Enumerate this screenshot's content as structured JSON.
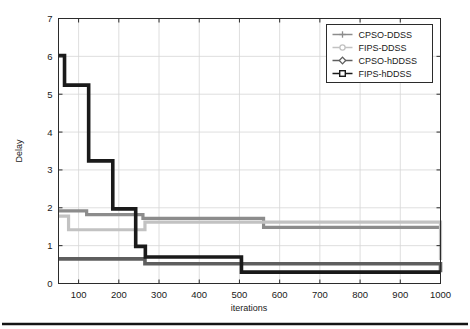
{
  "chart_data": {
    "type": "line",
    "title": "",
    "xlabel": "iterations",
    "ylabel": "Delay",
    "xlim": [
      50,
      1000
    ],
    "ylim": [
      0,
      7
    ],
    "xticks": [
      100,
      200,
      300,
      400,
      500,
      600,
      700,
      800,
      900,
      1000
    ],
    "yticks": [
      0,
      1,
      2,
      3,
      4,
      5,
      6,
      7
    ],
    "grid": true,
    "legend_position": "top-right",
    "step_style": "post",
    "series": [
      {
        "name": "CPSO-DDSS",
        "color": "#8c8c8c",
        "marker": "plus",
        "linewidth": 3.2,
        "x": [
          50,
          120,
          250,
          260,
          420,
          560,
          1000
        ],
        "y": [
          1.92,
          1.82,
          1.82,
          1.72,
          1.72,
          1.48,
          1.48
        ]
      },
      {
        "name": "FIPS-DDSS",
        "color": "#c2c2c2",
        "marker": "circle",
        "linewidth": 3.2,
        "x": [
          50,
          75,
          250,
          265,
          840,
          1000
        ],
        "y": [
          1.78,
          1.42,
          1.42,
          1.62,
          1.62,
          0.62
        ]
      },
      {
        "name": "CPSO-hDDSS",
        "color": "#5e5e5e",
        "marker": "diamond",
        "linewidth": 3.6,
        "x": [
          50,
          250,
          265,
          500,
          840,
          1000
        ],
        "y": [
          0.65,
          0.65,
          0.52,
          0.52,
          0.52,
          0.3
        ]
      },
      {
        "name": "FIPS-hDDSS",
        "color": "#1a1a1a",
        "marker": "square",
        "linewidth": 3.6,
        "x": [
          50,
          62,
          65,
          120,
          125,
          180,
          185,
          238,
          242,
          262,
          266,
          500,
          505,
          1000
        ],
        "y": [
          6.02,
          6.02,
          5.24,
          5.24,
          3.24,
          3.24,
          1.97,
          1.97,
          0.98,
          0.98,
          0.7,
          0.7,
          0.3,
          0.3
        ]
      }
    ]
  },
  "legend": {
    "entries": [
      {
        "label": "CPSO-DDSS"
      },
      {
        "label": "FIPS-DDSS"
      },
      {
        "label": "CPSO-hDDSS"
      },
      {
        "label": "FIPS-hDDSS"
      }
    ]
  },
  "axes": {
    "y_title": "Delay",
    "x_title": "iterations",
    "y_tick_labels": [
      "0",
      "1",
      "2",
      "3",
      "4",
      "5",
      "6",
      "7"
    ],
    "x_tick_labels": [
      "100",
      "200",
      "300",
      "400",
      "500",
      "600",
      "700",
      "800",
      "900",
      "1000"
    ]
  }
}
